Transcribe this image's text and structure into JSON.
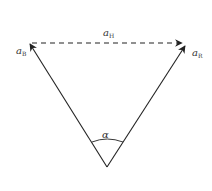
{
  "diagram": {
    "type": "vector-triangle",
    "labels": {
      "left_vector": {
        "main": "a",
        "sub": "B"
      },
      "top_vector": {
        "main": "a",
        "sub": "H"
      },
      "right_vector": {
        "main": "a",
        "sub": "R"
      },
      "angle": "α"
    },
    "colors": {
      "line": "#222222",
      "background": "#ffffff"
    },
    "vectors": [
      {
        "name": "left",
        "from": [
          107,
          167
        ],
        "to": [
          29,
          43
        ],
        "style": "solid"
      },
      {
        "name": "right",
        "from": [
          107,
          167
        ],
        "to": [
          186,
          45
        ],
        "style": "solid"
      },
      {
        "name": "top",
        "from": [
          31,
          43
        ],
        "to": [
          184,
          43
        ],
        "style": "dashed"
      }
    ]
  }
}
